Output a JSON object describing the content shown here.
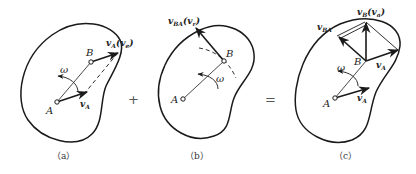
{
  "diagram": {
    "type": "rigid-body-velocity-composition",
    "colors": {
      "stroke": "#1a1a1a",
      "text": "#222222",
      "caption": "#333333"
    },
    "operators": {
      "plus": "+",
      "equals": "="
    },
    "panels": [
      {
        "id": "a",
        "caption": "（a）",
        "points": {
          "A": "A",
          "B": "B"
        },
        "omega": "ω",
        "vectors": {
          "vA": "v",
          "vA_sub": "A",
          "vB_label": "v",
          "vB_sub": "A",
          "vB_paren": "(v",
          "vB_paren_sub": "e",
          "vB_paren_close": ")"
        }
      },
      {
        "id": "b",
        "caption": "（b）",
        "points": {
          "A": "A",
          "B": "B"
        },
        "omega": "ω",
        "vectors": {
          "vBA": "v",
          "vBA_sub": "BA",
          "vBA_paren": "(v",
          "vBA_paren_sub": "r",
          "vBA_paren_close": ")"
        }
      },
      {
        "id": "c",
        "caption": "（c）",
        "points": {
          "A": "A",
          "B": "B"
        },
        "omega": "ω",
        "vectors": {
          "vBA": "v",
          "vBA_sub": "BA",
          "vB": "v",
          "vB_sub": "B",
          "vB_paren": "(v",
          "vB_paren_sub": "a",
          "vB_paren_close": ")",
          "vA_at_B": "v",
          "vA_at_B_sub": "A",
          "vA": "v",
          "vA_sub": "A"
        }
      }
    ]
  }
}
